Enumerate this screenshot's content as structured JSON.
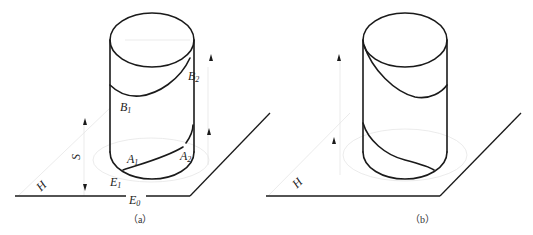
{
  "figure_a": {
    "caption": "（a）",
    "plane_label": "H",
    "height_label": "S",
    "points": {
      "B1": {
        "main": "B",
        "sub": "1"
      },
      "B2": {
        "main": "B",
        "sub": "2"
      },
      "A1": {
        "main": "A",
        "sub": "1"
      },
      "A2": {
        "main": "A",
        "sub": "2"
      },
      "E1": {
        "main": "E",
        "sub": "1"
      },
      "E0": {
        "main": "E",
        "sub": "0"
      }
    }
  },
  "figure_b": {
    "caption": "（b）",
    "plane_label": "H"
  },
  "colors": {
    "line": "#1a1a1a",
    "construction": "#e6e6e6",
    "background": "#ffffff"
  }
}
